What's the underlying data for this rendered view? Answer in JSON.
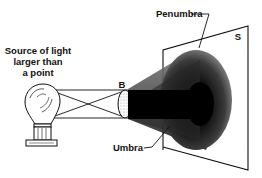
{
  "diagram": {
    "type": "shadow-formation",
    "labels": {
      "source_line1": "Source of light",
      "source_line2": "larger than",
      "source_line3": "a point",
      "obstacle": "B",
      "screen": "S",
      "penumbra": "Penumbra",
      "umbra": "Umbra"
    },
    "colors": {
      "ink": "#111111",
      "umbra": "#000000",
      "penumbra_edge": "#9a9a9a",
      "background": "#ffffff"
    }
  }
}
